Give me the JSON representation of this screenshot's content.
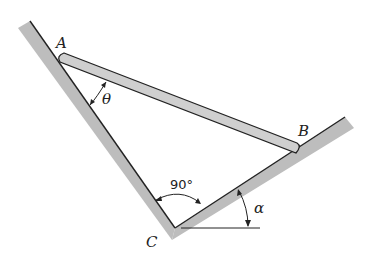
{
  "diagram": {
    "type": "mechanics-figure",
    "points": {
      "A": {
        "label": "A",
        "x": 62,
        "y": 58
      },
      "B": {
        "label": "B",
        "x": 295,
        "y": 148
      },
      "C": {
        "label": "C",
        "x": 175,
        "y": 228
      }
    },
    "angles": {
      "theta": {
        "label": "θ"
      },
      "right_angle": {
        "label": "90°"
      },
      "alpha": {
        "label": "α"
      }
    },
    "colors": {
      "line": "#222222",
      "wall_shade": "#bdbdbd",
      "rod_fill": "#cfcfcf"
    }
  }
}
